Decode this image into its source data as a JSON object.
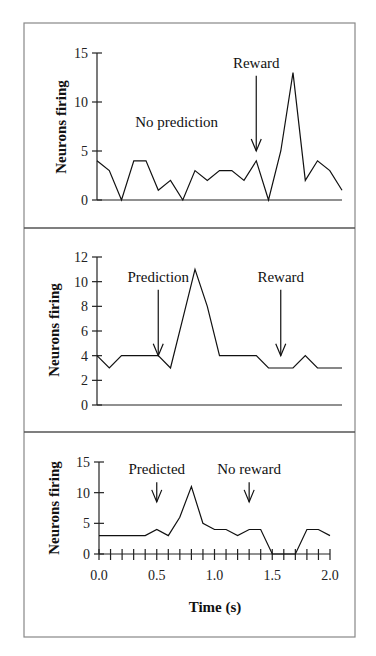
{
  "chart_data": [
    {
      "type": "line",
      "title": "",
      "xlabel": "",
      "ylabel": "Neurons firing",
      "ylim": [
        0,
        15
      ],
      "yticks": [
        "0",
        "5",
        "10",
        "15"
      ],
      "xlim": [
        0.0,
        2.0
      ],
      "x": [
        0.0,
        0.1,
        0.2,
        0.3,
        0.4,
        0.5,
        0.6,
        0.7,
        0.8,
        0.9,
        1.0,
        1.1,
        1.2,
        1.3,
        1.4,
        1.5,
        1.6,
        1.7,
        1.8,
        1.9,
        2.0
      ],
      "series": [
        {
          "name": "No prediction",
          "values": [
            4,
            3,
            0,
            4,
            4,
            1,
            2,
            0,
            3,
            2,
            3,
            3,
            2,
            4,
            0,
            5,
            13,
            2,
            4,
            3,
            1
          ]
        }
      ],
      "annotations": [
        {
          "text": "No prediction",
          "arrow": false,
          "x": 0.65,
          "y": 7.5
        },
        {
          "text": "Reward",
          "arrow": true,
          "x": 1.3,
          "y": 13.5,
          "arrow_to": 5
        }
      ],
      "grid": false
    },
    {
      "type": "line",
      "title": "",
      "xlabel": "",
      "ylabel": "Neurons firing",
      "ylim": [
        0,
        12
      ],
      "yticks": [
        "0",
        "2",
        "4",
        "6",
        "8",
        "10",
        "12"
      ],
      "xlim": [
        0.0,
        2.0
      ],
      "x": [
        0.0,
        0.1,
        0.2,
        0.3,
        0.4,
        0.5,
        0.6,
        0.7,
        0.8,
        0.9,
        1.0,
        1.1,
        1.2,
        1.3,
        1.4,
        1.5,
        1.6,
        1.7,
        1.8,
        1.9,
        2.0
      ],
      "series": [
        {
          "name": "Prediction",
          "values": [
            4,
            3,
            4,
            4,
            4,
            4,
            3,
            7,
            11,
            8,
            4,
            4,
            4,
            4,
            3,
            3,
            3,
            4,
            3,
            3,
            3
          ]
        }
      ],
      "annotations": [
        {
          "text": "Prediction",
          "arrow": true,
          "x": 0.5,
          "y": 10,
          "arrow_to": 4
        },
        {
          "text": "Reward",
          "arrow": true,
          "x": 1.5,
          "y": 10,
          "arrow_to": 4
        }
      ],
      "grid": false
    },
    {
      "type": "line",
      "title": "",
      "xlabel": "Time (s)",
      "ylabel": "Neurons firing",
      "ylim": [
        0,
        15
      ],
      "yticks": [
        "0",
        "5",
        "10",
        "15"
      ],
      "xlim": [
        0.0,
        2.0
      ],
      "xticks": [
        "0.0",
        "0.5",
        "1.0",
        "1.5",
        "2.0"
      ],
      "x": [
        0.0,
        0.1,
        0.2,
        0.3,
        0.4,
        0.5,
        0.6,
        0.7,
        0.8,
        0.9,
        1.0,
        1.1,
        1.2,
        1.3,
        1.4,
        1.5,
        1.6,
        1.7,
        1.8,
        1.9,
        2.0
      ],
      "series": [
        {
          "name": "Predicted, no reward",
          "values": [
            3,
            3,
            3,
            3,
            3,
            4,
            3,
            6,
            11,
            5,
            4,
            4,
            3,
            4,
            4,
            0,
            0,
            0,
            4,
            4,
            3
          ]
        }
      ],
      "annotations": [
        {
          "text": "Predicted",
          "arrow": true,
          "x": 0.5,
          "y": 13,
          "arrow_to": 8.5
        },
        {
          "text": "No reward",
          "arrow": true,
          "x": 1.3,
          "y": 13,
          "arrow_to": 8.5
        }
      ],
      "grid": false
    }
  ]
}
